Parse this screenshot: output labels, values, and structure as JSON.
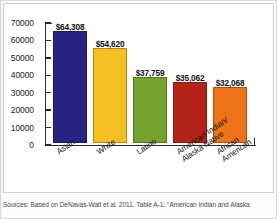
{
  "chart_data": {
    "type": "bar",
    "title": "",
    "subtitle": "",
    "xlabel": "",
    "ylabel": "",
    "categories": [
      "Asian",
      "White",
      "Latino",
      "American Indian/ Alaska Native",
      "African American"
    ],
    "category_lines": [
      [
        "Asian"
      ],
      [
        "White"
      ],
      [
        "Latino"
      ],
      [
        "American Indian/",
        "Alaska Native"
      ],
      [
        "African",
        "American"
      ]
    ],
    "values": [
      64308,
      54620,
      37759,
      35062,
      32068
    ],
    "value_labels": [
      "$64,308",
      "$54,620",
      "$37,759",
      "$35,062",
      "$32,068"
    ],
    "bar_colors": [
      "#262381",
      "#F5BE23",
      "#76A32D",
      "#B32317",
      "#EE7218"
    ],
    "ylim": [
      0,
      70000
    ],
    "ytick_values": [
      0,
      10000,
      20000,
      30000,
      40000,
      50000,
      60000,
      70000
    ],
    "ytick_labels": [
      "0",
      "10000",
      "20000",
      "30000",
      "40000",
      "50000",
      "60000",
      "70000"
    ],
    "grid": false,
    "legend": "none"
  },
  "caption": {
    "source_text": "Sources: Based on DeNavas-Walt et al. 2011. Table A-1: \"American Indian and Alaska"
  }
}
